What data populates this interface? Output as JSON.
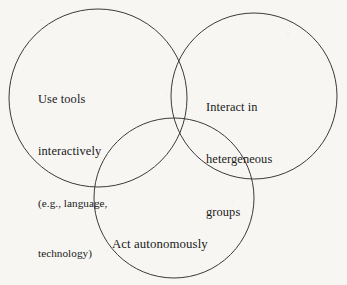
{
  "diagram": {
    "type": "venn-3-circle",
    "background_color": "#f7f6f3",
    "stroke_color": "#3a3a3c",
    "text_color": "#1a1a1a",
    "circles": [
      {
        "id": "use-tools",
        "center_x": 98,
        "center_y": 98,
        "radius": 89,
        "label_lines": [
          {
            "text": "Use tools",
            "style": "main"
          },
          {
            "text": "interactively",
            "style": "main"
          },
          {
            "text": "(e.g., language,",
            "style": "sub"
          },
          {
            "text": "technology)",
            "style": "sub"
          }
        ]
      },
      {
        "id": "interact-heterogeneous",
        "center_x": 254,
        "center_y": 96,
        "radius": 83,
        "label_lines": [
          {
            "text": "Interact in",
            "style": "main"
          },
          {
            "text": "hetergeneous",
            "style": "main"
          },
          {
            "text": "groups",
            "style": "main"
          }
        ]
      },
      {
        "id": "act-autonomously",
        "center_x": 174,
        "center_y": 198,
        "radius": 80,
        "label_lines": [
          {
            "text": "Act autonomously",
            "style": "main"
          }
        ]
      }
    ]
  },
  "labels": {
    "use_tools": {
      "line1": "Use tools",
      "line2": "interactively",
      "line3": "(e.g., language,",
      "line4": "technology)"
    },
    "interact": {
      "line1": "Interact in",
      "line2": "hetergeneous",
      "line3": "groups"
    },
    "act": {
      "line1": "Act autonomously"
    }
  }
}
